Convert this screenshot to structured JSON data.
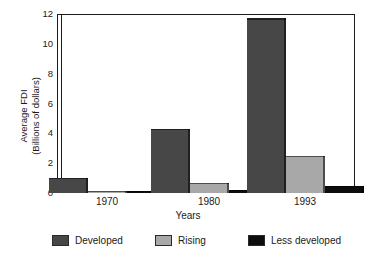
{
  "chart_data": {
    "type": "bar",
    "title": "",
    "xlabel": "Years",
    "ylabel": "Average FDI (Billions of dollars)",
    "ylabel_line1": "Average FDI",
    "ylabel_line2": "(Billions of dollars)",
    "categories": [
      "1970",
      "1980",
      "1993"
    ],
    "series": [
      {
        "name": "Developed",
        "color": "#474747",
        "values": [
          1.0,
          4.3,
          11.7
        ]
      },
      {
        "name": "Rising",
        "color": "#a8a8a8",
        "values": [
          0.1,
          0.7,
          2.5
        ]
      },
      {
        "name": "Less developed",
        "color": "#0d0d0d",
        "values": [
          0.05,
          0.2,
          0.5
        ]
      }
    ],
    "ylim": [
      0,
      12
    ],
    "yticks": [
      0,
      2,
      4,
      6,
      8,
      10,
      12
    ],
    "ytick_labels": [
      "0",
      "2",
      "4",
      "6",
      "8",
      "10",
      "12"
    ],
    "grid": false,
    "legend_position": "bottom"
  },
  "legend": {
    "items": [
      {
        "label": "Developed",
        "color": "#474747"
      },
      {
        "label": "Rising",
        "color": "#a8a8a8"
      },
      {
        "label": "Less developed",
        "color": "#0d0d0d"
      }
    ]
  },
  "axes": {
    "x_title": "Years",
    "y_title_line1": "Average FDI",
    "y_title_line2": "(Billions of dollars)",
    "x_tick_labels": [
      "1970",
      "1980",
      "1993"
    ],
    "y_tick_labels": [
      "12",
      "10",
      "8",
      "6",
      "4",
      "2",
      "0"
    ]
  },
  "colors": {
    "axis": "#1c1c1c",
    "background": "#ffffff",
    "developed": "#474747",
    "rising": "#a8a8a8",
    "less_developed": "#0d0d0d"
  }
}
